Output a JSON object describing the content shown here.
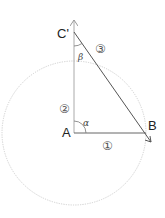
{
  "diagram": {
    "points": {
      "A": {
        "label": "A",
        "x": 74,
        "y": 133
      },
      "B": {
        "label": "B",
        "x": 146,
        "y": 133
      },
      "C_prime": {
        "label": "C'",
        "x": 74,
        "y": 32
      }
    },
    "angles": {
      "alpha": {
        "label": "α",
        "at": "A"
      },
      "beta": {
        "label": "β",
        "at": "C'"
      }
    },
    "segment_labels": {
      "one": {
        "label": "①",
        "segment": "A-B"
      },
      "two": {
        "label": "②",
        "segment": "A-C'"
      },
      "three": {
        "label": "③",
        "segment": "C'-B"
      }
    },
    "circle": {
      "center": "A",
      "radius": 72,
      "style": "dotted",
      "color": "#c8c8c8"
    },
    "colors": {
      "lines": "#555555",
      "vertical_axis": "#aaaaaa",
      "text": "#222222"
    }
  }
}
